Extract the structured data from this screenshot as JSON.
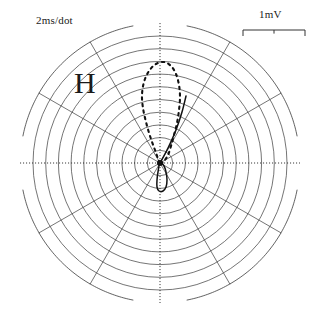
{
  "figure": {
    "kind": "vectorcardiogram-polar-plot",
    "width": 319,
    "height": 335,
    "background_color": "#ffffff",
    "ink_color": "#3a3a3a",
    "trace_color": "#111111"
  },
  "labels": {
    "time_scale": "2ms/dot",
    "voltage_scale": "1mV",
    "plane": "H"
  },
  "scale_bar": {
    "name": "voltage-scale-bar",
    "x_start": 243,
    "x_end": 305,
    "y": 30,
    "tick_positions": [
      243,
      274,
      305
    ],
    "tick_length": 6,
    "represents": "1mV"
  },
  "chart_data": {
    "type": "line",
    "title": "",
    "subtitle": "",
    "xlabel": "",
    "ylabel": "",
    "coordinate_system": "polar",
    "center": [
      160,
      163
    ],
    "grid": {
      "on": true,
      "rings": 11,
      "ring_spacing_px": 12.7,
      "outer_radius_px": 140,
      "spoke_count": 12,
      "spoke_step_degrees": 30,
      "axis_style": "dotted",
      "ring_style": "solid-thin",
      "outer_ring_gaps_degrees": [
        [
          80,
          100
        ],
        [
          170,
          190
        ],
        [
          260,
          280
        ],
        [
          350,
          10
        ]
      ]
    },
    "legend": {
      "position": "none",
      "entries": []
    },
    "annotations": [
      {
        "name": "time-scale",
        "text": "2ms/dot",
        "x": 36,
        "y": 14
      },
      {
        "name": "voltage-scale",
        "text": "1mV",
        "x": 259,
        "y": 8
      },
      {
        "name": "plane-label",
        "text": "H",
        "x": 74,
        "y": 68
      }
    ],
    "series": [
      {
        "name": "qrs-loop-dashed",
        "style": "dashed",
        "description": "large upward vector loop, counterclockwise, dashed",
        "points": [
          [
            160,
            163
          ],
          [
            155,
            150
          ],
          [
            150,
            136
          ],
          [
            146,
            122
          ],
          [
            143,
            108
          ],
          [
            142,
            95
          ],
          [
            144,
            82
          ],
          [
            149,
            71
          ],
          [
            156,
            64
          ],
          [
            164,
            62
          ],
          [
            171,
            66
          ],
          [
            176,
            74
          ],
          [
            179,
            85
          ],
          [
            180,
            97
          ],
          [
            179,
            110
          ],
          [
            177,
            123
          ],
          [
            174,
            135
          ],
          [
            171,
            146
          ],
          [
            168,
            155
          ],
          [
            164,
            161
          ],
          [
            160,
            163
          ]
        ]
      },
      {
        "name": "t-loop-solid",
        "style": "solid",
        "description": "small downward loop below origin, solid",
        "points": [
          [
            160,
            163
          ],
          [
            158,
            172
          ],
          [
            157,
            180
          ],
          [
            157,
            187
          ],
          [
            159,
            191
          ],
          [
            163,
            191
          ],
          [
            166,
            187
          ],
          [
            167,
            180
          ],
          [
            166,
            172
          ],
          [
            164,
            166
          ],
          [
            160,
            163
          ]
        ]
      },
      {
        "name": "loop-entry-limbs",
        "style": "solid",
        "description": "converging limbs at origin",
        "points": [
          [
            160,
            163
          ],
          [
            168,
            148
          ],
          [
            176,
            130
          ],
          [
            182,
            112
          ],
          [
            186,
            96
          ]
        ]
      }
    ],
    "axis_ranges": {
      "radial_px": [
        0,
        140
      ],
      "angular_degrees": [
        0,
        360
      ]
    }
  }
}
